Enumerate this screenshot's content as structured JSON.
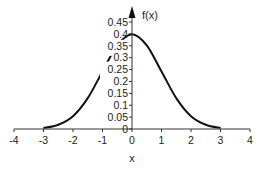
{
  "chart_data": {
    "type": "line",
    "title": "",
    "xlabel": "x",
    "ylabel": "f(x)",
    "xlim": [
      -4,
      4
    ],
    "ylim": [
      0,
      0.45
    ],
    "xticks": [
      "-4",
      "-3",
      "-2",
      "-1",
      "0",
      "1",
      "2",
      "3",
      "4"
    ],
    "yticks": [
      "0",
      "0.05",
      "0.1",
      "0.15",
      "0.2",
      "0.25",
      "0.3",
      "0.35",
      "0.4",
      "0.45"
    ],
    "grid": false,
    "legend": "none",
    "series": [
      {
        "name": "f(x)",
        "x": [
          -3,
          -2.5,
          -2,
          -1.5,
          -1,
          -0.5,
          0,
          0.5,
          1,
          1.5,
          2,
          2.5,
          3
        ],
        "y": [
          0.004,
          0.018,
          0.054,
          0.13,
          0.242,
          0.352,
          0.399,
          0.352,
          0.242,
          0.13,
          0.054,
          0.018,
          0.004
        ]
      }
    ]
  }
}
